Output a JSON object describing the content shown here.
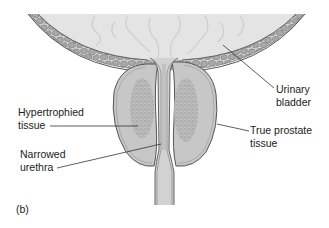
{
  "figure": {
    "panel_label": "(b)",
    "colors": {
      "bladder_interior": "#e4e4e4",
      "wall_band": "#cfcfcf",
      "cobblestone": "#a9a9a9",
      "outline": "#555555",
      "prostate_lobe": "#c7c7c7",
      "hypertrophied": "#ababab",
      "urethra": "#d2d2d2",
      "leader_line": "#333333",
      "text": "#222222"
    },
    "labels": {
      "urinary_bladder": [
        "Urinary",
        "bladder"
      ],
      "hypertrophied_tissue": [
        "Hypertrophied",
        "tissue"
      ],
      "true_prostate_tissue": [
        "True prostate",
        "tissue"
      ],
      "narrowed_urethra": [
        "Narrowed",
        "urethra"
      ]
    }
  }
}
